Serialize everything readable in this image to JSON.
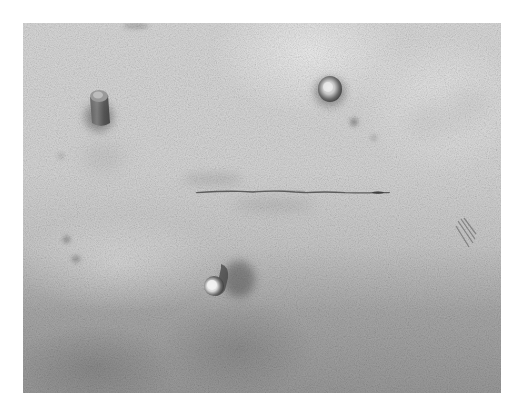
{
  "image": {
    "description": "Grayscale photograph of skin surface showing a horizontal linear incision and three small raised cylindrical protrusions",
    "colors": {
      "frame_background": "#ffffff",
      "skin_light": "#d9d9d9",
      "skin_dark": "#9a9a9a",
      "incision": "#4a4a4a",
      "protrusion_highlight": "#f0f0f0",
      "protrusion_shadow": "#3c3c3c"
    },
    "features": [
      {
        "name": "incision-line",
        "position": "center",
        "orientation": "horizontal"
      },
      {
        "name": "protrusion-upper-left",
        "position": "upper-left"
      },
      {
        "name": "protrusion-upper-right",
        "position": "upper-right"
      },
      {
        "name": "protrusion-lower-center",
        "position": "lower-center"
      },
      {
        "name": "dark-patch-right",
        "position": "right-middle"
      }
    ]
  }
}
